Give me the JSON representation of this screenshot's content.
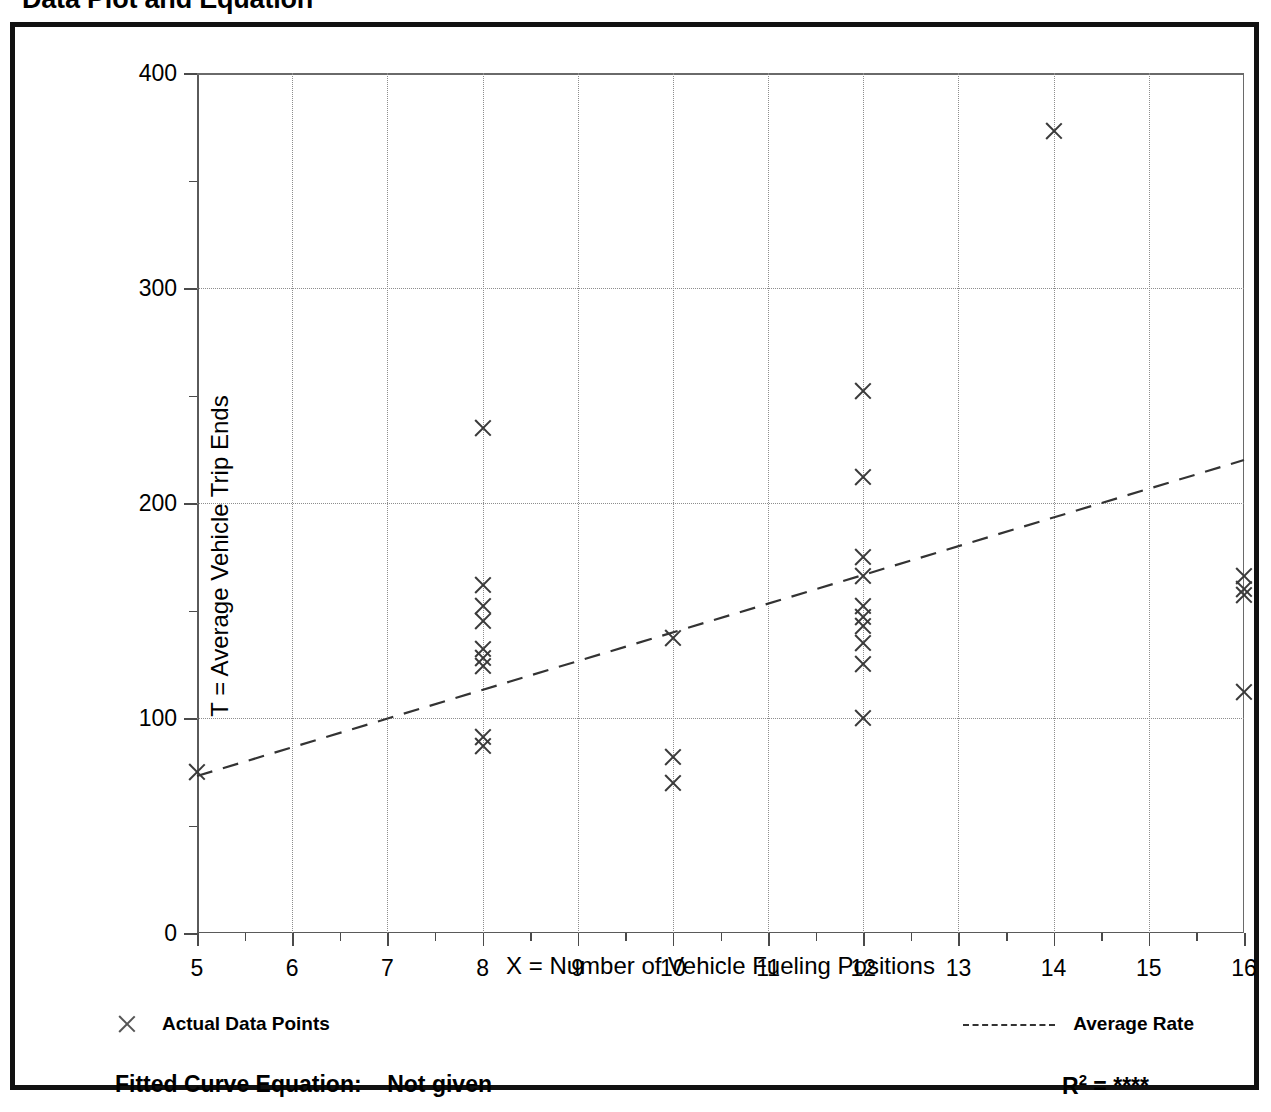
{
  "page": {
    "title": "Data Plot and Equation"
  },
  "chart_data": {
    "type": "scatter",
    "title": "Data Plot and Equation",
    "xlabel": "X = Number of Vehicle Fueling Positions",
    "ylabel": "T = Average Vehicle Trip Ends",
    "xlim": [
      5,
      16
    ],
    "ylim": [
      0,
      400
    ],
    "x_ticks": [
      5,
      6,
      7,
      8,
      9,
      10,
      11,
      12,
      13,
      14,
      15,
      16
    ],
    "x_tick_labels": [
      "5",
      "6",
      "7",
      "8",
      "9",
      "10",
      "11",
      "12",
      "13",
      "14",
      "15",
      "16"
    ],
    "y_ticks": [
      0,
      100,
      200,
      300,
      400
    ],
    "y_tick_labels": [
      "0",
      "100",
      "200",
      "300",
      "400"
    ],
    "y_minor_ticks": [
      50,
      150,
      250,
      350
    ],
    "grid": "dotted gridlines at major x and y ticks",
    "legend_position": "below-plot-split",
    "series": [
      {
        "name": "Actual Data Points",
        "type": "scatter",
        "marker": "x",
        "points": [
          [
            5,
            75
          ],
          [
            8,
            235
          ],
          [
            8,
            162
          ],
          [
            8,
            152
          ],
          [
            8,
            145
          ],
          [
            8,
            132
          ],
          [
            8,
            128
          ],
          [
            8,
            124
          ],
          [
            8,
            91
          ],
          [
            8,
            87
          ],
          [
            10,
            137
          ],
          [
            10,
            82
          ],
          [
            10,
            70
          ],
          [
            12,
            252
          ],
          [
            12,
            212
          ],
          [
            12,
            175
          ],
          [
            12,
            166
          ],
          [
            12,
            152
          ],
          [
            12,
            147
          ],
          [
            12,
            143
          ],
          [
            12,
            135
          ],
          [
            12,
            125
          ],
          [
            12,
            100
          ],
          [
            14,
            373
          ],
          [
            16,
            166
          ],
          [
            16,
            160
          ],
          [
            16,
            157
          ],
          [
            16,
            112
          ]
        ]
      },
      {
        "name": "Average Rate",
        "type": "line",
        "style": "dashed",
        "endpoints": [
          [
            5,
            73
          ],
          [
            16,
            220
          ]
        ]
      }
    ]
  },
  "legend": {
    "actual_points_label": "Actual Data Points",
    "average_rate_label": "Average Rate"
  },
  "footer": {
    "equation_label": "Fitted Curve Equation:",
    "equation_value": "Not given",
    "r_squared_label": "R",
    "r_squared_exponent": "2",
    "r_squared_equals": "=",
    "r_squared_value": "****"
  }
}
